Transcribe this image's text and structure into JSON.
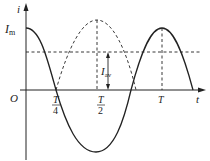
{
  "diagram": {
    "title": "",
    "axes": {
      "y_label": "i",
      "x_label": "t",
      "origin_label": "O"
    },
    "labels": {
      "peak": {
        "main": "I",
        "sub": "m"
      },
      "average": {
        "main": "I",
        "sub": "av"
      },
      "t_quarter": {
        "num": "T",
        "den": "4"
      },
      "t_half": {
        "num": "T",
        "den": "2"
      },
      "t_full": "T"
    },
    "curves": [
      {
        "name": "current-solid",
        "style": "solid",
        "shape": "cosine",
        "description": "i = Im cos(2πt/T)"
      },
      {
        "name": "rectified-dashed",
        "style": "dashed",
        "shape": "inverted half-wave between T/4 and 3T/4"
      }
    ],
    "guides": [
      {
        "name": "average-level",
        "style": "dashed",
        "description": "horizontal line at Iav"
      },
      {
        "name": "half-period-vertical",
        "style": "dashed"
      },
      {
        "name": "full-period-vertical",
        "style": "dashed"
      }
    ],
    "colors": {
      "stroke": "#222222",
      "background": "#ffffff"
    }
  }
}
